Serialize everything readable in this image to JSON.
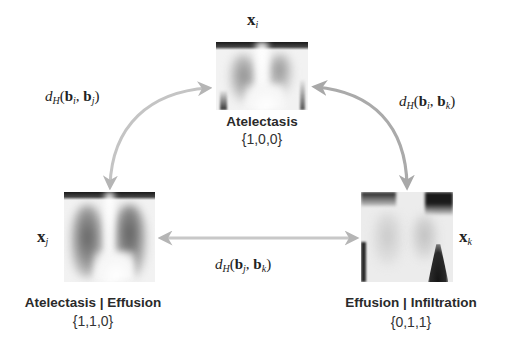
{
  "diagram": {
    "type": "triangle-relation",
    "arrow_color": "#b8b8b8",
    "nodes": [
      {
        "id": "i",
        "variable": "x",
        "subscript": "i",
        "label": "Atelectasis",
        "vector": "{1,0,0}"
      },
      {
        "id": "j",
        "variable": "x",
        "subscript": "j",
        "label": "Atelectasis | Effusion",
        "vector": "{1,1,0}"
      },
      {
        "id": "k",
        "variable": "x",
        "subscript": "k",
        "label": "Effusion |  Infiltration",
        "vector": "{0,1,1}"
      }
    ],
    "edges": [
      {
        "from": "i",
        "to": "j",
        "fn": "d",
        "fn_sub": "H",
        "arg1": "b",
        "arg1_sub": "i",
        "arg2": "b",
        "arg2_sub": "j"
      },
      {
        "from": "i",
        "to": "k",
        "fn": "d",
        "fn_sub": "H",
        "arg1": "b",
        "arg1_sub": "i",
        "arg2": "b",
        "arg2_sub": "k"
      },
      {
        "from": "j",
        "to": "k",
        "fn": "d",
        "fn_sub": "H",
        "arg1": "b",
        "arg1_sub": "j",
        "arg2": "b",
        "arg2_sub": "k"
      }
    ],
    "punct": {
      "open": "(",
      "comma": ", ",
      "close": ")"
    }
  }
}
